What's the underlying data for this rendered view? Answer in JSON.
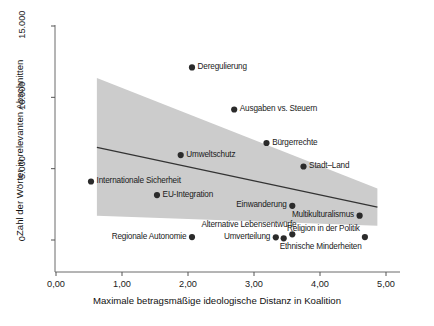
{
  "chart_data": {
    "type": "scatter",
    "title": "",
    "xlabel": "Maximale betragsmäßige ideologische Distanz in Koalition",
    "ylabel": "Zahl der Wörter in relevanten Abschnitten",
    "xlim": [
      0,
      5
    ],
    "ylim": [
      -2500,
      16000
    ],
    "grid": false,
    "legend": null,
    "xticks": [
      "0,00",
      "1,00",
      "2,00",
      "3,00",
      "4,00",
      "5,00"
    ],
    "xtick_values": [
      0,
      1,
      2,
      3,
      4,
      5
    ],
    "yticks": [
      "0",
      "5.000",
      "10.000",
      "15.000"
    ],
    "ytick_values": [
      0,
      5000,
      10000,
      15000
    ],
    "point_color": "#2b2b2b",
    "band_color": "#cccccc",
    "line_color": "#333333",
    "axis_color": "#555555",
    "points": [
      {
        "label": "Deregulierung",
        "x": 2.06,
        "y": 12100,
        "label_side": "right"
      },
      {
        "label": "Ausgaben vs. Steuern",
        "x": 2.7,
        "y": 9150,
        "label_side": "right"
      },
      {
        "label": "Bürgerrechte",
        "x": 3.19,
        "y": 6800,
        "label_side": "right"
      },
      {
        "label": "Umweltschutz",
        "x": 1.89,
        "y": 5950,
        "label_side": "right"
      },
      {
        "label": "Stadt–Land",
        "x": 3.75,
        "y": 5150,
        "label_side": "right"
      },
      {
        "label": "Internationale Sicherheit",
        "x": 0.53,
        "y": 4100,
        "label_side": "right"
      },
      {
        "label": "EU-Integration",
        "x": 1.53,
        "y": 3150,
        "label_side": "right"
      },
      {
        "label": "Einwanderung",
        "x": 3.58,
        "y": 2400,
        "label_side": "left"
      },
      {
        "label": "Multikulturalismus",
        "x": 4.6,
        "y": 1700,
        "label_side": "left"
      },
      {
        "label": "Religion in der Politik",
        "x": 4.68,
        "y": 200,
        "label_side": "left_below"
      },
      {
        "label": "Alternative Lebensentwürfe",
        "x": 3.58,
        "y": 400,
        "label_side": "above"
      },
      {
        "label": "Umverteilung",
        "x": 3.33,
        "y": 190,
        "label_side": "left"
      },
      {
        "label": "Regionale Autonomie",
        "x": 2.06,
        "y": 200,
        "label_side": "left"
      },
      {
        "label": "Ethnische Minderheiten",
        "x": 3.45,
        "y": 120,
        "label_side": "below_right"
      }
    ],
    "regression_line": {
      "x_start": 0.62,
      "y_start": 6500,
      "x_end": 4.87,
      "y_end": 2300
    },
    "confidence_band": {
      "x_start": 0.62,
      "x_end": 4.87,
      "upper_start": 11350,
      "upper_end": 3600,
      "lower_start": 1700,
      "lower_end": 1000
    }
  },
  "axis": {
    "x_title": "Maximale betragsmäßige ideologische Distanz in Koalition",
    "y_title": "Zahl der Wörter in relevanten Abschnitten"
  }
}
